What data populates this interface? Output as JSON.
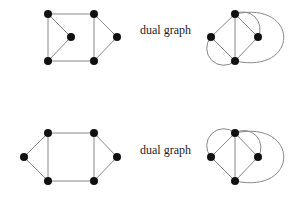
{
  "diagrams": [
    {
      "id": "top",
      "label": "dual graph",
      "label_pos": [
        140,
        30
      ],
      "graph": {
        "nodes": [
          [
            48,
            14
          ],
          [
            94,
            14
          ],
          [
            71,
            37
          ],
          [
            117,
            37
          ],
          [
            48,
            61
          ],
          [
            94,
            61
          ]
        ],
        "edges": [
          [
            0,
            1
          ],
          [
            0,
            2
          ],
          [
            0,
            4
          ],
          [
            2,
            4
          ],
          [
            1,
            5
          ],
          [
            1,
            3
          ],
          [
            3,
            5
          ],
          [
            4,
            5
          ]
        ]
      },
      "dual": {
        "nodes": [
          [
            235,
            14
          ],
          [
            211,
            37
          ],
          [
            258,
            37
          ],
          [
            235,
            61
          ]
        ],
        "edges": [
          [
            0,
            1
          ],
          [
            0,
            3
          ],
          [
            0,
            2
          ],
          [
            1,
            3
          ],
          [
            2,
            3
          ]
        ],
        "arcs": [
          {
            "d": "M235,14 A17,17 0 0 1 258,37"
          },
          {
            "d": "M211,37 A17,17 0 0 0 235,61"
          },
          {
            "d": "M235,14 C300,0 300,75 235,61"
          }
        ]
      }
    },
    {
      "id": "bottom",
      "label": "dual graph",
      "label_pos": [
        140,
        150
      ],
      "graph": {
        "nodes": [
          [
            48,
            133
          ],
          [
            94,
            133
          ],
          [
            24,
            157
          ],
          [
            117,
            157
          ],
          [
            48,
            181
          ],
          [
            94,
            181
          ]
        ],
        "edges": [
          [
            0,
            1
          ],
          [
            0,
            2
          ],
          [
            2,
            4
          ],
          [
            0,
            4
          ],
          [
            1,
            5
          ],
          [
            1,
            3
          ],
          [
            3,
            5
          ],
          [
            4,
            5
          ]
        ]
      },
      "dual": {
        "nodes": [
          [
            235,
            133
          ],
          [
            211,
            157
          ],
          [
            258,
            157
          ],
          [
            235,
            181
          ]
        ],
        "edges": [
          [
            0,
            1
          ],
          [
            0,
            3
          ],
          [
            0,
            2
          ],
          [
            1,
            3
          ],
          [
            2,
            3
          ]
        ],
        "arcs": [
          {
            "d": "M211,157 A17,17 0 0 1 235,133"
          },
          {
            "d": "M235,133 A17,17 0 0 1 258,157"
          },
          {
            "d": "M235,133 C300,119 300,195 235,181"
          }
        ]
      }
    }
  ],
  "style": {
    "node_color": "#111111",
    "edge_color": "#888888",
    "node_radius": 4
  }
}
